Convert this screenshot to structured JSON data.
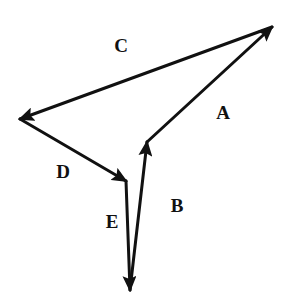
{
  "diagram": {
    "type": "vector-polygon",
    "stroke_color": "#111111",
    "background": "#ffffff",
    "points": {
      "P_top_right": [
        272,
        27
      ],
      "P_left": [
        20,
        119
      ],
      "P_mid_left": [
        126,
        181
      ],
      "P_bottom": [
        130,
        290
      ],
      "P_mid_right": [
        147,
        142
      ]
    },
    "vectors": [
      {
        "id": "A",
        "label": "A",
        "from": "P_mid_right",
        "to": "P_top_right",
        "label_pos": [
          223,
          112
        ]
      },
      {
        "id": "C",
        "label": "C",
        "from": "P_top_right",
        "to": "P_left",
        "label_pos": [
          121,
          45
        ]
      },
      {
        "id": "D",
        "label": "D",
        "from": "P_left",
        "to": "P_mid_left",
        "label_pos": [
          63,
          171
        ]
      },
      {
        "id": "E",
        "label": "E",
        "from": "P_mid_left",
        "to": "P_bottom",
        "label_pos": [
          112,
          221
        ]
      },
      {
        "id": "B",
        "label": "B",
        "from": "P_bottom",
        "to": "P_mid_right",
        "label_pos": [
          177,
          205
        ]
      }
    ]
  },
  "labels": {
    "A": "A",
    "B": "B",
    "C": "C",
    "D": "D",
    "E": "E"
  }
}
